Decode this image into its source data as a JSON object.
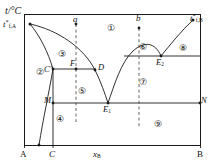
{
  "figure": {
    "type": "phase-diagram",
    "axes": {
      "y_axis_label": "t/°C",
      "x_axis_label": "x",
      "x_axis_label_sub": "B",
      "x_left_endpoint": "A",
      "x_right_endpoint": "B",
      "x_tick_c": "C"
    },
    "corner_labels": {
      "top_left_melting_point": "t",
      "top_left_melting_point_sup": "*",
      "top_left_melting_point_sub": "f,A",
      "top_right_melting_point": "t",
      "top_right_melting_point_sup": "*",
      "top_right_melting_point_sub": "f,B"
    },
    "cooling_lines": [
      {
        "name": "a",
        "label": "a",
        "x_fraction": 0.295
      },
      {
        "name": "b",
        "label": "b",
        "x_fraction": 0.655
      }
    ],
    "points": [
      {
        "name": "C-prime",
        "label": "C",
        "prime": "′"
      },
      {
        "name": "F",
        "label": "F"
      },
      {
        "name": "D",
        "label": "D"
      },
      {
        "name": "M",
        "label": "M"
      },
      {
        "name": "N",
        "label": "N"
      },
      {
        "name": "E1",
        "label": "E",
        "sub": "1"
      },
      {
        "name": "E2",
        "label": "E",
        "sub": "2"
      }
    ],
    "regions": [
      {
        "id": 1,
        "label": "①"
      },
      {
        "id": 2,
        "label": "②"
      },
      {
        "id": 3,
        "label": "③"
      },
      {
        "id": 4,
        "label": "④"
      },
      {
        "id": 5,
        "label": "⑤"
      },
      {
        "id": 6,
        "label": "⑥"
      },
      {
        "id": 7,
        "label": "⑦"
      },
      {
        "id": 8,
        "label": "⑧"
      },
      {
        "id": 9,
        "label": "⑨"
      }
    ],
    "colors": {
      "line": "#1a1a1a",
      "background": "#ffffff",
      "text": "#111111"
    }
  }
}
